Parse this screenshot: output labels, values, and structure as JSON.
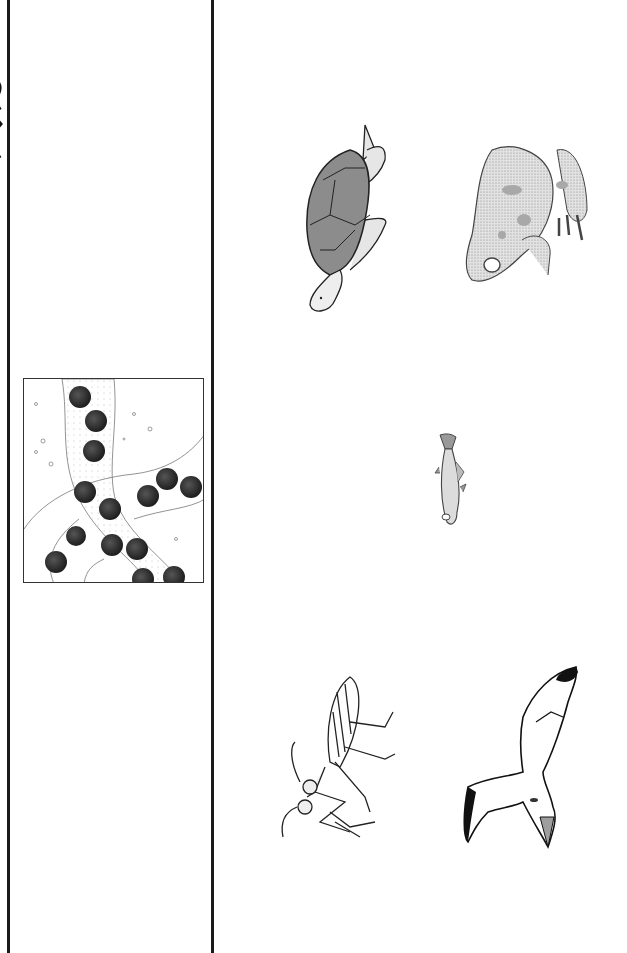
{
  "page": {
    "background": "#ffffff",
    "line_color": "#1a1a1a"
  },
  "left_column": {
    "edge_text": "",
    "illustration": {
      "subject": "frog-eggs",
      "egg_color": "#2b2b2b",
      "egg_count": 15
    }
  },
  "right_column": {
    "animals": [
      {
        "name": "sea-turtle",
        "shell_color": "#8c8c8c"
      },
      {
        "name": "frog",
        "fill_color": "#d9d9d9",
        "spot_color": "#9a9a9a"
      },
      {
        "name": "fish",
        "fill_color": "#dcdcdc"
      },
      {
        "name": "mantis-insect",
        "fill_color": "#ffffff"
      },
      {
        "name": "seagull",
        "wingtip_color": "#111111",
        "beak_color": "#9e9e9e"
      }
    ]
  }
}
